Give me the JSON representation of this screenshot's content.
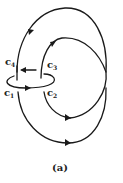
{
  "figure": {
    "caption": "(a)",
    "labels": {
      "c1": {
        "base": "c",
        "sub": "1"
      },
      "c2": {
        "base": "c",
        "sub": "2"
      },
      "c3": {
        "base": "c",
        "sub": "3"
      },
      "c4": {
        "base": "c",
        "sub": "4"
      }
    },
    "stroke_color": "#1a1a1a",
    "background": "#ffffff"
  }
}
